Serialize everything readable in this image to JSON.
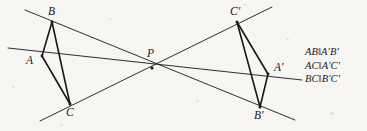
{
  "figure": {
    "type": "geometry-diagram",
    "background_color": "#f7f6f3",
    "ink_color": "#18171a",
    "width": 367,
    "height": 131
  },
  "points": [
    {
      "id": "B",
      "label": "B",
      "x": 52,
      "y": 22,
      "label_x": 48,
      "label_y": 6
    },
    {
      "id": "A",
      "label": "A",
      "x": 42,
      "y": 56,
      "label_x": 26,
      "label_y": 55
    },
    {
      "id": "C",
      "label": "C",
      "x": 70,
      "y": 104,
      "label_x": 66,
      "label_y": 107
    },
    {
      "id": "P",
      "label": "P",
      "x": 152,
      "y": 68,
      "label_x": 147,
      "label_y": 48
    },
    {
      "id": "Cp",
      "label": "C′",
      "x": 237,
      "y": 22,
      "label_x": 230,
      "label_y": 6
    },
    {
      "id": "Ap",
      "label": "A′",
      "x": 268,
      "y": 74,
      "label_x": 274,
      "label_y": 62
    },
    {
      "id": "Bp",
      "label": "B′",
      "x": 260,
      "y": 107,
      "label_x": 254,
      "label_y": 110
    }
  ],
  "triangles": [
    {
      "id": "ABC",
      "vertices": [
        "A",
        "B",
        "C"
      ]
    },
    {
      "id": "ApBpCp",
      "vertices": [
        "Ap",
        "Bp",
        "Cp"
      ]
    }
  ],
  "perspective_lines": [
    {
      "id": "line-B-P-Bp",
      "from": [
        25,
        10
      ],
      "to": [
        295,
        120
      ]
    },
    {
      "id": "line-A-P-Ap",
      "from": [
        8,
        48
      ],
      "to": [
        302,
        80
      ]
    },
    {
      "id": "line-C-P-Cp",
      "from": [
        40,
        121
      ],
      "to": [
        272,
        7
      ]
    }
  ],
  "relations": {
    "title": "parallel-side-relations",
    "lines": [
      "AB‖A′B′",
      "AC‖A′C′",
      "BC‖B′C′"
    ]
  }
}
